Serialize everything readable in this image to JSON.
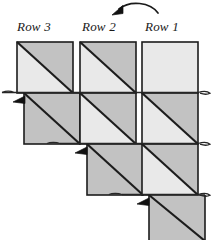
{
  "figure": {
    "background": "#ffffff",
    "width": 211,
    "height": 240,
    "labels": [
      {
        "id": "row3",
        "text": "Row 3",
        "x": 17,
        "y": 19
      },
      {
        "id": "row2",
        "text": "Row 2",
        "x": 82,
        "y": 19
      },
      {
        "id": "row1",
        "text": "Row 1",
        "x": 145,
        "y": 19
      }
    ],
    "colors": {
      "fill_light": "#e9e9e9",
      "fill_dark": "#c2c2c2",
      "stroke": "#1c1c1c",
      "stroke_thin": "#2a2a2a",
      "text": "#1a1a1a",
      "page": "#ffffff"
    },
    "geometry": {
      "cell_width": 56,
      "cell_height": 51,
      "column_gap": 7,
      "columns": [
        {
          "name": "Row 3",
          "x": 17,
          "top": 42,
          "cells": 2,
          "start_index": 0
        },
        {
          "name": "Row 2",
          "x": 80,
          "top": 42,
          "cells": 3,
          "start_index": 0
        },
        {
          "name": "Row 1",
          "x": 142,
          "top": 42,
          "cells": 4,
          "start_index": 0
        }
      ]
    },
    "markers": {
      "arrowhead_count": 3,
      "arrowhead_label": "row-turn-arrowhead",
      "connector_count": 3,
      "connector_label": "serpentine-connector",
      "top_arrow_label": "traversal-direction-arrow"
    },
    "notes": {
      "diagonal_direction": "top-left to bottom-right",
      "upper_triangle_shade": "dark",
      "lower_triangle_shade": "light",
      "first_cell_of_row1_plain": true
    }
  }
}
